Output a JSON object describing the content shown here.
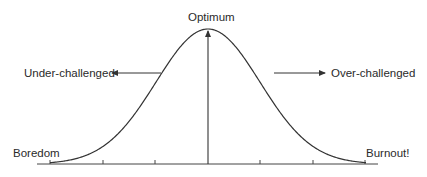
{
  "diagram": {
    "type": "bell-curve",
    "labels": {
      "peak": "Optimum",
      "left_arrow": "Under-challenged",
      "right_arrow": "Over-challenged",
      "left_end": "Boredom",
      "right_end": "Burnout!"
    },
    "colors": {
      "line": "#333333",
      "text": "#2a2a2a",
      "background": "#ffffff"
    },
    "axis": {
      "tick_count": 7
    }
  },
  "chart_data": {
    "type": "line",
    "title": "",
    "xlabel": "",
    "ylabel": "",
    "grid": false,
    "annotations": [
      "Optimum",
      "Under-challenged",
      "Over-challenged",
      "Boredom",
      "Burnout!"
    ],
    "series": [
      {
        "name": "bell-curve",
        "shape": "gaussian",
        "peak_label": "Optimum"
      }
    ]
  }
}
